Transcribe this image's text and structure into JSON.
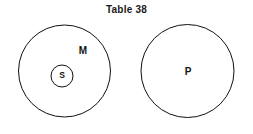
{
  "figure": {
    "title": "Table 38",
    "kind": "euler-diagram",
    "background_color": "#ffffff",
    "stroke_color": "#111111"
  },
  "chart_data": {
    "type": "diagram",
    "title": "Table 38",
    "xlabel": "",
    "ylabel": "",
    "sets": [
      {
        "label": "M",
        "name": "middle-term-set",
        "cx": 64.5,
        "cy": 71,
        "r": 46,
        "label_x": 83,
        "label_y": 51,
        "contains": [
          "S"
        ]
      },
      {
        "label": "S",
        "name": "subject-term-set",
        "cx": 62,
        "cy": 76,
        "r": 11,
        "label_x": 62,
        "label_y": 76,
        "contains": []
      },
      {
        "label": "P",
        "name": "predicate-term-set",
        "cx": 187.5,
        "cy": 71,
        "r": 46.5,
        "label_x": 187.5,
        "label_y": 72,
        "contains": []
      }
    ],
    "relations": [
      {
        "from": "S",
        "to": "M",
        "type": "subset"
      },
      {
        "from": "M",
        "to": "P",
        "type": "disjoint"
      },
      {
        "from": "S",
        "to": "P",
        "type": "disjoint"
      }
    ],
    "legend": [],
    "grid": false
  },
  "labels": {
    "m": "M",
    "s": "S",
    "p": "P"
  }
}
